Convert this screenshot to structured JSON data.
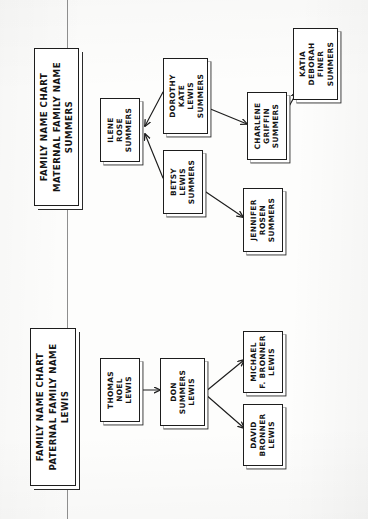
{
  "document": {
    "kind": "hand-drawn-family-tree-scan",
    "orientation": "rotated-90-counterclockwise",
    "ink_color": "#1d1d1d",
    "paper_color": "#fdfdfc"
  },
  "charts": [
    {
      "id": "maternal",
      "title_lines": [
        "FAMILY NAME CHART",
        "MATERNAL FAMILY NAME",
        "SUMMERS"
      ],
      "title_box": {
        "x": 34,
        "y": 48,
        "w": 45,
        "h": 158
      },
      "nodes": [
        {
          "id": "ilene",
          "lines": [
            "ILENE",
            "ROSE",
            "SUMMERS"
          ],
          "x": 100,
          "y": 98,
          "w": 40,
          "h": 64
        },
        {
          "id": "dorothy",
          "lines": [
            "DOROTHY",
            "KATE",
            "LEWIS",
            "SUMMERS"
          ],
          "x": 163,
          "y": 58,
          "w": 45,
          "h": 76
        },
        {
          "id": "betsy",
          "lines": [
            "BETSY",
            "LEWIS",
            "SUMMERS"
          ],
          "x": 163,
          "y": 150,
          "w": 40,
          "h": 64
        },
        {
          "id": "charlene",
          "lines": [
            "CHARLENE",
            "GRIFFIN",
            "SUMMERS"
          ],
          "x": 247,
          "y": 92,
          "w": 40,
          "h": 68
        },
        {
          "id": "jennifer",
          "lines": [
            "JENNIFER",
            "ROSEN",
            "SUMMERS"
          ],
          "x": 243,
          "y": 188,
          "w": 40,
          "h": 64
        },
        {
          "id": "katia",
          "lines": [
            "KATIA",
            "DEBORAH",
            "FINER",
            "SUMMERS"
          ],
          "x": 293,
          "y": 28,
          "w": 45,
          "h": 72
        }
      ],
      "edges": [
        {
          "from": "ilene",
          "to": "dorothy"
        },
        {
          "from": "ilene",
          "to": "betsy"
        },
        {
          "from": "dorothy",
          "to": "charlene"
        },
        {
          "from": "betsy",
          "to": "jennifer"
        },
        {
          "from": "charlene",
          "to": "katia"
        }
      ]
    },
    {
      "id": "paternal",
      "title_lines": [
        "FAMILY NAME CHART",
        "PATERNAL FAMILY NAME",
        "LEWIS"
      ],
      "title_box": {
        "x": 30,
        "y": 328,
        "w": 46,
        "h": 158
      },
      "nodes": [
        {
          "id": "thomas",
          "lines": [
            "THOMAS",
            "NOEL",
            "LEWIS"
          ],
          "x": 100,
          "y": 358,
          "w": 40,
          "h": 64
        },
        {
          "id": "don",
          "lines": [
            "DON",
            "SUMMERS",
            "LEWIS"
          ],
          "x": 160,
          "y": 358,
          "w": 45,
          "h": 68
        },
        {
          "id": "michael",
          "lines": [
            "MICHAEL",
            "F. BRONNER",
            "LEWIS"
          ],
          "x": 243,
          "y": 331,
          "w": 40,
          "h": 62
        },
        {
          "id": "david",
          "lines": [
            "DAVID",
            "BRONNER",
            "LEWIS"
          ],
          "x": 243,
          "y": 404,
          "w": 40,
          "h": 62
        }
      ],
      "edges": [
        {
          "from": "thomas",
          "to": "don"
        },
        {
          "from": "don",
          "to": "michael"
        },
        {
          "from": "don",
          "to": "david"
        }
      ]
    }
  ]
}
